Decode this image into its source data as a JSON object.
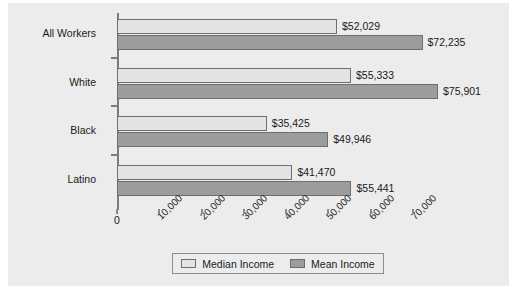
{
  "chart_data": {
    "type": "bar",
    "orientation": "horizontal",
    "title": "",
    "xlabel": "",
    "ylabel": "",
    "categories": [
      "All Workers",
      "White",
      "Black",
      "Latino"
    ],
    "series": [
      {
        "name": "Median Income",
        "color": "#e3e3e3",
        "values": [
          52029,
          55333,
          35425,
          41470
        ],
        "labels": [
          "$52,029",
          "$55,333",
          "$35,425",
          "$41,470"
        ]
      },
      {
        "name": "Mean Income",
        "color": "#9c9c9c",
        "values": [
          72235,
          75901,
          49946,
          55441
        ],
        "labels": [
          "$72,235",
          "$75,901",
          "$49,946",
          "$55,441"
        ]
      }
    ],
    "xlim": [
      0,
      78500
    ],
    "xticks": [
      0,
      10000,
      20000,
      30000,
      40000,
      50000,
      60000,
      70000
    ],
    "xticklabels": [
      "0",
      "10,000",
      "20,000",
      "30,000",
      "40,000",
      "50,000",
      "60,000",
      "70,000"
    ],
    "grid": false,
    "legend_position": "bottom-center",
    "legend": [
      "Median Income",
      "Mean Income"
    ],
    "plot_background": "#ececec",
    "axis_color": "#7c7c7c"
  }
}
